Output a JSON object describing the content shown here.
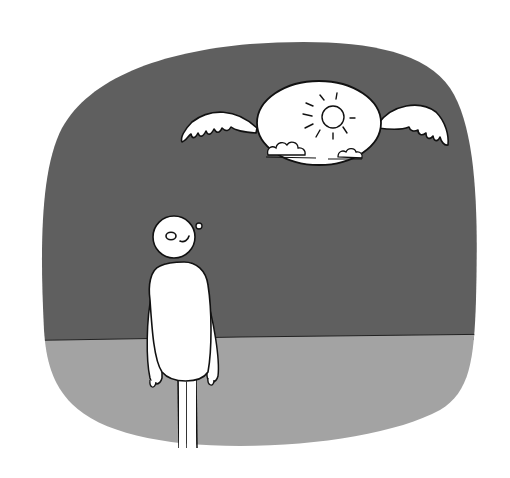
{
  "illustration": {
    "description": "Cartoon of a simple white figure standing on the ground, looking up at a winged orb showing a sunny sky with clouds, floating in a dark sky.",
    "colors": {
      "background": "#ffffff",
      "sky": "#5f5f5f",
      "ground": "#a3a3a3",
      "figure": "#ffffff",
      "outline": "#111111"
    },
    "elements": {
      "sky": "dark-sky",
      "ground": "grey-ground",
      "orb": "winged-sun-orb",
      "figure": "standing-person"
    }
  }
}
